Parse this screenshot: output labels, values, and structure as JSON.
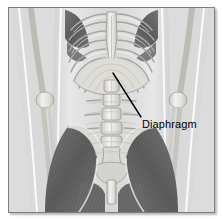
{
  "figure": {
    "kind": "anatomical-illustration",
    "view": "anterior",
    "style": "grayscale line drawing with shading",
    "frame": {
      "border_color": "#7d7d7d",
      "background": "#dcdcdc",
      "page_background": "#ffffff"
    }
  },
  "annotations": [
    {
      "id": "diaphragm",
      "label": "Diaphragm",
      "leader_line": {
        "from_x": 112,
        "from_y": 72,
        "to_x": 140,
        "to_y": 116,
        "color": "#000000",
        "width": 1.4
      },
      "label_x": 133,
      "label_y": 110
    }
  ],
  "structures": {
    "bone_light": "#eceae6",
    "bone_mid": "#cfcdc8",
    "bone_outline": "#8d8b87",
    "muscle_dark": "#5a5a5a",
    "muscle_mid": "#7e7e7e",
    "muscle_light": "#a8a8a8",
    "soft_tissue": "#d3d3d3",
    "highlight": "#f7f6f3",
    "names": [
      "ribcage",
      "sternum",
      "costal cartilage",
      "diaphragm",
      "lumbar vertebrae",
      "iliac crest",
      "pelvis",
      "pubic symphysis",
      "humerus",
      "radius",
      "ulna",
      "elbow joint",
      "intercostal muscles",
      "iliopsoas",
      "adductor muscles",
      "femur"
    ]
  }
}
